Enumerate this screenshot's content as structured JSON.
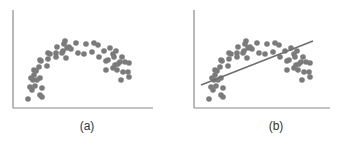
{
  "colors": {
    "dot": "#7b7b7b",
    "axis": "#8a8a8a",
    "fit_line": "#6e6e6e",
    "caption": "#333333"
  },
  "chart_data": [
    {
      "type": "scatter",
      "title": "",
      "caption": "(a)",
      "xlabel": "",
      "ylabel": "",
      "grid": false,
      "legend": null,
      "axis_box_px": {
        "x0": 13,
        "y0": 10,
        "x1": 153,
        "y1": 108
      },
      "description": "Inverted-U (arch-shaped) nonlinear scatter pattern",
      "points": [
        [
          28,
          99
        ],
        [
          32,
          90
        ],
        [
          40,
          95
        ],
        [
          42,
          97
        ],
        [
          30,
          87
        ],
        [
          35,
          86
        ],
        [
          33,
          80
        ],
        [
          37,
          80
        ],
        [
          31,
          78
        ],
        [
          36,
          71
        ],
        [
          34,
          70
        ],
        [
          42,
          88
        ],
        [
          40,
          78
        ],
        [
          39,
          67
        ],
        [
          41,
          61
        ],
        [
          34,
          75
        ],
        [
          47,
          66
        ],
        [
          48,
          59
        ],
        [
          40,
          60
        ],
        [
          50,
          54
        ],
        [
          48,
          53
        ],
        [
          56,
          57
        ],
        [
          56,
          53
        ],
        [
          57,
          47
        ],
        [
          62,
          53
        ],
        [
          64,
          44
        ],
        [
          63,
          51
        ],
        [
          65,
          41
        ],
        [
          67,
          48
        ],
        [
          69,
          47
        ],
        [
          71,
          49
        ],
        [
          66,
          58
        ],
        [
          76,
          43
        ],
        [
          78,
          53
        ],
        [
          86,
          44
        ],
        [
          84,
          54
        ],
        [
          94,
          43
        ],
        [
          92,
          52
        ],
        [
          98,
          45
        ],
        [
          99,
          57
        ],
        [
          104,
          51
        ],
        [
          106,
          61
        ],
        [
          108,
          60
        ],
        [
          110,
          48
        ],
        [
          113,
          54
        ],
        [
          114,
          57
        ],
        [
          116,
          51
        ],
        [
          118,
          64
        ],
        [
          120,
          62
        ],
        [
          122,
          57
        ],
        [
          115,
          65
        ],
        [
          123,
          72
        ],
        [
          125,
          62
        ],
        [
          129,
          63
        ],
        [
          106,
          70
        ],
        [
          113,
          68
        ],
        [
          117,
          70
        ],
        [
          121,
          80
        ],
        [
          128,
          72
        ],
        [
          129,
          77
        ]
      ]
    },
    {
      "type": "scatter",
      "title": "",
      "caption": "(b)",
      "xlabel": "",
      "ylabel": "",
      "grid": false,
      "legend": null,
      "axis_box_px": {
        "x0": 194,
        "y0": 10,
        "x1": 330,
        "y1": 108
      },
      "description": "Same inverted-U scatter with a straight linear regression line fitted through it",
      "fit_line": {
        "type": "linear",
        "x1": 201,
        "y1": 85,
        "x2": 313,
        "y2": 41
      },
      "points_offset_x_from_a": 181
    }
  ]
}
